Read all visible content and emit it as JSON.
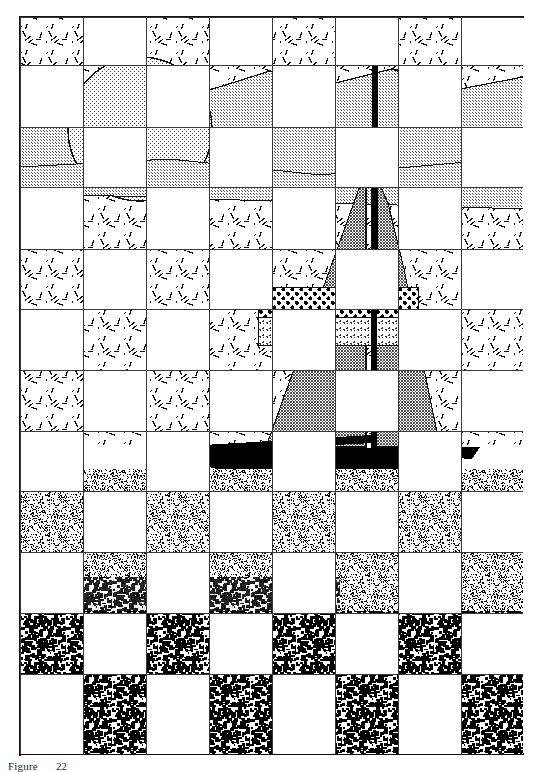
{
  "figure": {
    "caption_label": "Figure",
    "caption_number": "22",
    "alt_description": "Halftone line-art of a sailboat on water under a sun and clouds, overlaid with a checkerboard mask that blanks alternating cells"
  },
  "canvas": {
    "width": 503,
    "height": 737,
    "background": "#ffffff",
    "ink": "#111111"
  },
  "grid": {
    "label": "checkerboard-mask",
    "columns": 8,
    "rows": 12,
    "col_edges": [
      0,
      63,
      126,
      189,
      252,
      315,
      378,
      441,
      503
    ],
    "row_edges": [
      0,
      48,
      110,
      170,
      232,
      292,
      353,
      414,
      474,
      535,
      596,
      657,
      737
    ],
    "parity_visible": "even",
    "line_color": "#3a3a3a",
    "line_width": 1
  },
  "scene": {
    "elements": [
      {
        "name": "sky",
        "texture": "dash-sparse",
        "tone": "light"
      },
      {
        "name": "sun",
        "texture": "dot-fine",
        "tone": "light-gray",
        "cx": 120,
        "cy": 112,
        "r": 72
      },
      {
        "name": "cloud-band",
        "texture": "dot-medium",
        "tone": "mid-gray"
      },
      {
        "name": "horizon",
        "texture": "line",
        "tone": "dark"
      },
      {
        "name": "mainsail",
        "texture": "check-medium",
        "tone": "mid-gray"
      },
      {
        "name": "jib-sail",
        "texture": "check-medium",
        "tone": "mid-gray"
      },
      {
        "name": "sail-stripe",
        "texture": "polka-dot",
        "tone": "dark"
      },
      {
        "name": "sail-band",
        "texture": "stipple-fine",
        "tone": "light"
      },
      {
        "name": "mast",
        "texture": "solid",
        "tone": "black"
      },
      {
        "name": "boom",
        "texture": "solid",
        "tone": "black"
      },
      {
        "name": "hull",
        "texture": "solid",
        "tone": "black"
      },
      {
        "name": "water-near",
        "texture": "noise-coarse",
        "tone": "dark"
      },
      {
        "name": "water-far",
        "texture": "noise-fine",
        "tone": "mid"
      }
    ]
  },
  "colors": {
    "black": "#000000",
    "ink": "#111111",
    "gray_dark": "#4a4a4a",
    "gray_mid": "#8a8a8a",
    "gray_light": "#c9c9c9",
    "white": "#ffffff"
  }
}
